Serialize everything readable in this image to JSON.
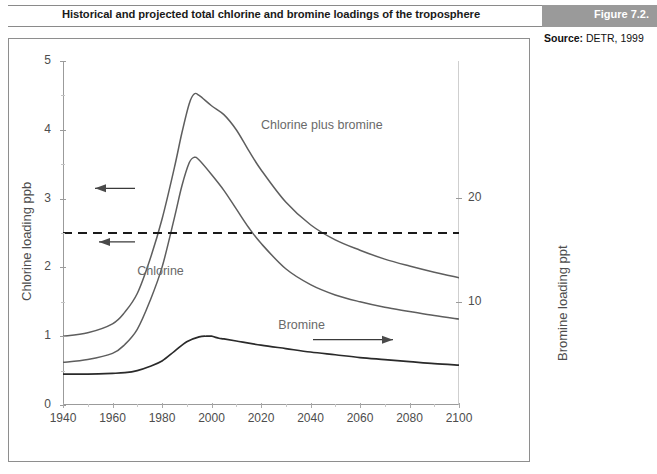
{
  "header": {
    "title": "Historical and projected total chlorine and bromine loadings of the troposphere",
    "figure_label": "Figure 7.2.",
    "source_key": "Source:",
    "source_value": "DETR, 1999",
    "band_color": "#9a9a9a"
  },
  "chart_data": {
    "type": "line",
    "title": "Historical and projected total chlorine and bromine loadings of the troposphere",
    "xlabel": "Year",
    "ylabel": "Chlorine  loading  ppb",
    "ylabel_right": "Bromine loading ppt",
    "xlim": [
      1940,
      2100
    ],
    "ylim": [
      0,
      5
    ],
    "ylim_right": [
      0,
      33.3
    ],
    "xticks": [
      1940,
      1960,
      1980,
      2000,
      2020,
      2040,
      2060,
      2080,
      2100
    ],
    "xtick_labels": [
      "1940",
      "1960",
      "1980",
      "2000",
      "2020",
      "2040",
      "2060",
      "2080",
      "2100"
    ],
    "yticks": [
      0,
      1,
      2,
      3,
      4,
      5
    ],
    "ytick_labels": [
      "0",
      "1",
      "2",
      "3",
      "4",
      "5"
    ],
    "yticks_right": [
      10,
      20
    ],
    "ytick_labels_right": [
      "10",
      "20"
    ],
    "grid": false,
    "legend": "inline-annotations",
    "annotations": [
      {
        "name": "chlorine-plus-bromine-label",
        "text": "Chlorine plus bromine",
        "x": 2020,
        "y": 4.05
      },
      {
        "name": "chlorine-label",
        "text": "Chlorine",
        "x": 1970,
        "y": 1.93
      },
      {
        "name": "bromine-label",
        "text": "Bromine",
        "x": 2027,
        "y": 1.15
      },
      {
        "name": "threshold-dashed-line",
        "text": "",
        "y": 2.5
      },
      {
        "name": "left-axis-arrow-upper",
        "text": "",
        "y": 3.15
      },
      {
        "name": "left-axis-arrow-lower",
        "text": "",
        "y": 2.37
      },
      {
        "name": "right-axis-arrow",
        "text": "",
        "y": 0.95
      }
    ],
    "series": [
      {
        "name": "Chlorine plus bromine",
        "axis": "left",
        "color": "#5e5e5e",
        "x": [
          1940,
          1950,
          1960,
          1965,
          1970,
          1975,
          1980,
          1985,
          1988,
          1991,
          1993,
          1995,
          2000,
          2005,
          2010,
          2015,
          2020,
          2030,
          2040,
          2050,
          2060,
          2070,
          2080,
          2090,
          2100
        ],
        "y": [
          1.0,
          1.05,
          1.18,
          1.35,
          1.62,
          2.1,
          2.7,
          3.45,
          3.95,
          4.38,
          4.52,
          4.5,
          4.35,
          4.22,
          4.0,
          3.7,
          3.42,
          2.95,
          2.62,
          2.4,
          2.25,
          2.12,
          2.02,
          1.93,
          1.85
        ]
      },
      {
        "name": "Chlorine",
        "axis": "left",
        "color": "#5e5e5e",
        "x": [
          1940,
          1950,
          1960,
          1965,
          1970,
          1975,
          1980,
          1985,
          1988,
          1991,
          1993,
          1995,
          2000,
          2005,
          2010,
          2015,
          2020,
          2030,
          2040,
          2050,
          2060,
          2070,
          2080,
          2090,
          2100
        ],
        "y": [
          0.62,
          0.66,
          0.75,
          0.88,
          1.1,
          1.5,
          2.0,
          2.72,
          3.18,
          3.52,
          3.6,
          3.56,
          3.35,
          3.12,
          2.85,
          2.58,
          2.35,
          1.98,
          1.75,
          1.6,
          1.5,
          1.42,
          1.36,
          1.3,
          1.25
        ]
      },
      {
        "name": "Bromine",
        "axis": "right",
        "color": "#2a2a2a",
        "x": [
          1940,
          1950,
          1960,
          1965,
          1970,
          1975,
          1980,
          1985,
          1990,
          1995,
          1998,
          2000,
          2003,
          2005,
          2010,
          2020,
          2030,
          2040,
          2050,
          2060,
          2070,
          2080,
          2090,
          2100
        ],
        "y": [
          0.45,
          0.45,
          0.46,
          0.47,
          0.5,
          0.56,
          0.64,
          0.78,
          0.92,
          0.99,
          1.0,
          1.0,
          0.97,
          0.96,
          0.93,
          0.87,
          0.82,
          0.77,
          0.73,
          0.69,
          0.66,
          0.63,
          0.6,
          0.58
        ]
      }
    ]
  }
}
